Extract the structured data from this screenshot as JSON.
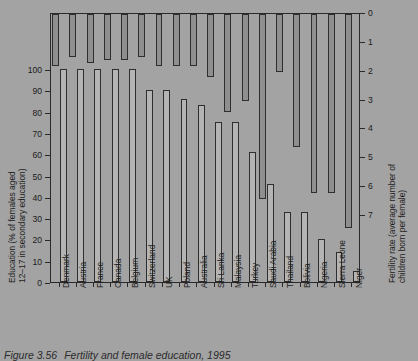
{
  "caption": {
    "number": "Figure 3.56",
    "text": "Fertility and female education, 1995"
  },
  "axes": {
    "left": {
      "title_line1": "Education (% of females aged",
      "title_line2": "12–17 in secondary education)",
      "ticks": [
        "100",
        "90",
        "80",
        "70",
        "60",
        "50",
        "40",
        "30",
        "20",
        "10",
        "0"
      ],
      "min": 0,
      "max": 100
    },
    "right": {
      "title_line1": "Fertility rate (average number of",
      "title_line2": "children born per female)",
      "ticks": [
        "0",
        "1",
        "2",
        "3",
        "4",
        "5",
        "6",
        "7"
      ],
      "min": 0,
      "max": 7,
      "inverted": true
    }
  },
  "chart_data": {
    "type": "bar",
    "title": "Fertility and female education, 1995",
    "xlabel": "",
    "ylabel": "Education (% of females aged 12–17 in secondary education)",
    "ylabel_right": "Fertility rate (average number of children born per female)",
    "ylim": [
      0,
      100
    ],
    "ylim_right": [
      0,
      7
    ],
    "right_axis_inverted": true,
    "grid": false,
    "legend": "none",
    "categories": [
      "Denmark",
      "Austria",
      "France",
      "Canada",
      "Belgium",
      "Switzerland",
      "UK",
      "Poland",
      "Australia",
      "Sri Lanka",
      "Malaysia",
      "Turkey",
      "Saudi Arabia",
      "Thailand",
      "Bolivia",
      "Nigeria",
      "Sierra Leone",
      "Niger"
    ],
    "series": [
      {
        "name": "Fertility rate (average number of children born per female)",
        "axis": "right",
        "units": "children per female",
        "values": [
          1.8,
          1.5,
          1.7,
          1.6,
          1.6,
          1.5,
          1.8,
          1.8,
          1.8,
          2.2,
          3.4,
          3.0,
          6.4,
          2.0,
          4.6,
          6.2,
          6.2,
          7.4
        ]
      },
      {
        "name": "Education (% of females aged 12–17 in secondary education)",
        "axis": "left",
        "units": "%",
        "values": [
          100,
          100,
          100,
          100,
          100,
          90,
          90,
          86,
          83,
          75,
          75,
          61,
          46,
          33,
          33,
          20,
          14,
          5
        ]
      }
    ]
  },
  "colors": {
    "background": "#a3a3a3",
    "fertility_bar": "#8f8f8f",
    "education_bar": "#b4b4b4",
    "outline": "#2e2e2e",
    "text": "#1b1b1b"
  }
}
